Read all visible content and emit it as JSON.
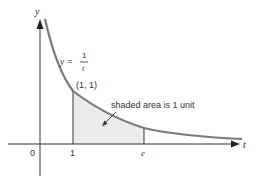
{
  "diagram": {
    "axes": {
      "x_label": "t",
      "y_label": "y",
      "origin_label": "0"
    },
    "curve": {
      "equation_lhs": "y =",
      "equation_num": "1",
      "equation_den": "t",
      "color": "#7a7a7a"
    },
    "point_label": "(1, 1)",
    "ticks": {
      "one": "1",
      "e": "e"
    },
    "annotation": "shaded area is 1 unit",
    "shade_color": "#ececec",
    "axis_color": "#333333"
  }
}
